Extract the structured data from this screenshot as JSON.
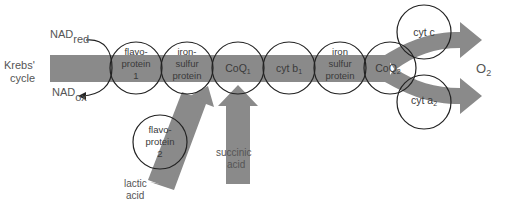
{
  "diagram": {
    "colors": {
      "band": "#8a8a8a",
      "circle_stroke": "#222222",
      "text": "#555555",
      "background": "#ffffff"
    },
    "inputs": {
      "krebs": {
        "line1": "Krebs'",
        "line2": "cycle"
      },
      "nad_red": {
        "base": "NAD",
        "sub": "red"
      },
      "nad_ox": {
        "base": "NAD",
        "sub": "ox"
      },
      "lactic": {
        "line1": "lactic",
        "line2": "acid"
      },
      "succinic": {
        "line1": "succinic",
        "line2": "acid"
      }
    },
    "carriers": [
      {
        "line1": "flavo-",
        "line2": "protein",
        "line3": "1"
      },
      {
        "line1": "iron-",
        "line2": "sulfur",
        "line3": "protein"
      },
      {
        "base": "CoQ",
        "sub": "1"
      },
      {
        "base": "cyt b",
        "sub": "1"
      },
      {
        "line1": "iron",
        "line2": "sulfur",
        "line3": "protein"
      },
      {
        "base": "CoQ",
        "sub": "2"
      }
    ],
    "branch": {
      "upper": {
        "base": "cyt c"
      },
      "lower": {
        "base": "cyt a",
        "sub": "2"
      },
      "side": {
        "line1": "flavo-",
        "line2": "protein",
        "line3": "2"
      }
    },
    "output": {
      "base": "O",
      "sub": "2"
    }
  }
}
